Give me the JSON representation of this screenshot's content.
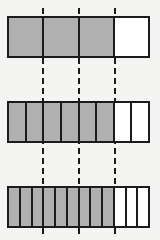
{
  "figure": {
    "title": "",
    "background_color": "#f4f4f2",
    "line_color": "#1b1b1b",
    "shaded_color": "#b0b0b0",
    "unshaded_color": "#ffffff"
  },
  "guides": {
    "style": "dashed",
    "color": "#1b1b1b",
    "count": 3,
    "positions_px": [
      42,
      78,
      114
    ],
    "fraction_positions": [
      "1/4",
      "2/4",
      "3/4"
    ]
  },
  "bars": [
    {
      "name": "bar-fourths",
      "total_cells": 4,
      "shaded_cells": 3,
      "unshaded_cells": 1,
      "fraction": "3/4",
      "top_px": 16,
      "left_px": 7,
      "width_px": 143,
      "height_px": 42,
      "cells": [
        {
          "shaded": true
        },
        {
          "shaded": true
        },
        {
          "shaded": true
        },
        {
          "shaded": false
        }
      ]
    },
    {
      "name": "bar-eighths",
      "total_cells": 8,
      "shaded_cells": 6,
      "unshaded_cells": 2,
      "fraction": "6/8",
      "top_px": 101,
      "left_px": 7,
      "width_px": 143,
      "height_px": 42,
      "cells": [
        {
          "shaded": true
        },
        {
          "shaded": true
        },
        {
          "shaded": true
        },
        {
          "shaded": true
        },
        {
          "shaded": true
        },
        {
          "shaded": true
        },
        {
          "shaded": false
        },
        {
          "shaded": false
        }
      ]
    },
    {
      "name": "bar-twelfths",
      "total_cells": 12,
      "shaded_cells": 9,
      "unshaded_cells": 3,
      "fraction": "9/12",
      "top_px": 186,
      "left_px": 7,
      "width_px": 143,
      "height_px": 42,
      "cells": [
        {
          "shaded": true
        },
        {
          "shaded": true
        },
        {
          "shaded": true
        },
        {
          "shaded": true
        },
        {
          "shaded": true
        },
        {
          "shaded": true
        },
        {
          "shaded": true
        },
        {
          "shaded": true
        },
        {
          "shaded": true
        },
        {
          "shaded": false
        },
        {
          "shaded": false
        },
        {
          "shaded": false
        }
      ]
    }
  ],
  "chart_data": {
    "type": "bar",
    "subtitle": "",
    "xlabel": "",
    "ylabel": "",
    "categories": [
      "3/4",
      "6/8",
      "9/12"
    ],
    "values": [
      0.75,
      0.75,
      0.75
    ],
    "series": [
      {
        "name": "shaded parts",
        "values": [
          3,
          6,
          9
        ]
      },
      {
        "name": "total parts",
        "values": [
          4,
          8,
          12
        ]
      }
    ],
    "annotations": [
      "dashed guide at 1/4",
      "dashed guide at 2/4",
      "dashed guide at 3/4"
    ],
    "grid": false,
    "legend": "none",
    "xlim": [
      0,
      1
    ],
    "ylim": [
      0,
      1
    ]
  }
}
